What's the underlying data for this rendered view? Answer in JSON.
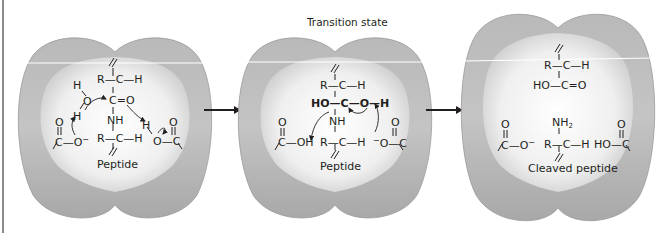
{
  "figure": {
    "colors": {
      "enzyme_outer": "#a9a9a9",
      "enzyme_inner_center": "#ffffff",
      "enzyme_inner_edge": "#c8c8c8",
      "ink": "#231f20",
      "frame": "#8a8a8a"
    }
  },
  "panels": [
    {
      "id": "substrate",
      "title": "",
      "label": "Peptide",
      "structure": {
        "top_bond": "R—C—H",
        "carbonyl": "C=O",
        "amide": "NH",
        "bottom_bond": "R—C—H",
        "water_H_top": "H",
        "water_O": "O",
        "water_H_bottom": "H",
        "left_carboxylate": "C—O",
        "left_carboxylate_charge": "−",
        "left_carbonyl_O": "O",
        "right_acid_H": "H",
        "right_acid": "O—C",
        "right_carbonyl_O": "O"
      }
    },
    {
      "id": "transition",
      "title": "Transition state",
      "label": "Peptide",
      "structure": {
        "top_bond": "R—C—H",
        "tetrahedral": "HO—C—O—H",
        "amide": "NH",
        "bottom_bond": "R—C—H",
        "left_acid": "C—OH",
        "left_carbonyl_O": "O",
        "right_carboxylate": "O—C",
        "right_carboxylate_charge": "−",
        "right_carbonyl_O": "O"
      }
    },
    {
      "id": "products",
      "title": "",
      "label": "Cleaved peptide",
      "structure": {
        "top_bond": "R—C—H",
        "acid": "HO—C=O",
        "amine": "NH",
        "amine_sub": "2",
        "bottom_bond": "R—C—H",
        "left_carboxylate": "C—O",
        "left_carboxylate_charge": "−",
        "left_carbonyl_O": "O",
        "right_acid": "HO—C",
        "right_carbonyl_O": "O"
      }
    }
  ],
  "arrows": [
    {
      "from": "substrate",
      "to": "transition",
      "icon": "right-arrow-icon"
    },
    {
      "from": "transition",
      "to": "products",
      "icon": "right-arrow-icon"
    }
  ]
}
